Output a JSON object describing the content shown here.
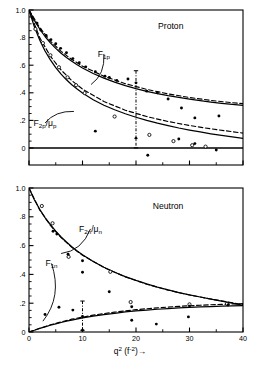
{
  "figure": {
    "background": "#ffffff",
    "ink": "#000000",
    "x_axis": {
      "label_main": "q",
      "label_exp": "2",
      "label_units": "(f",
      "label_units_exp": "-2",
      "label_units_close": ")",
      "arrow": "→",
      "full_label": "q2 (f-2)→",
      "ticks": [
        0,
        10,
        20,
        30,
        40
      ],
      "tick_labels": [
        "0",
        "10",
        "20",
        "30",
        "40"
      ],
      "range": [
        0,
        40
      ],
      "minor_tick_step": 5
    },
    "y_axis": {
      "ticks": [
        0,
        0.2,
        0.4,
        0.6,
        0.8,
        1.0
      ],
      "tick_labels": [
        "0",
        ".2",
        ".4",
        ".6",
        ".8",
        "1.0"
      ],
      "tick_labels_lower": [
        "0",
        ".2",
        ".4",
        ".6",
        ".8",
        "1.0"
      ],
      "range": [
        0,
        1.0
      ],
      "range_upper_panel": [
        -0.12,
        1.0
      ],
      "minor_tick_step": 0.05
    }
  },
  "chart_data": [
    {
      "type": "scatter",
      "panel": "upper",
      "title": "Proton",
      "xlabel": "",
      "ylabel": "",
      "xlim": [
        0,
        40
      ],
      "ylim": [
        -0.12,
        1.0
      ],
      "grid": false,
      "legend": "inline-annotations",
      "annotations": [
        {
          "text": "Proton",
          "x": 26.5,
          "y": 0.86
        },
        {
          "text": "F1p",
          "x": 14.0,
          "y": 0.66,
          "leader_to_x": 11.6,
          "leader_to_y": 0.46
        },
        {
          "text": "F2p/μp",
          "x": 3.0,
          "y": 0.16,
          "leader_to_x": 8.4,
          "leader_to_y": 0.265
        }
      ],
      "series": [
        {
          "name": "F1p solid model curve",
          "style": "solid-line",
          "x": [
            0,
            1,
            2,
            3,
            4,
            5,
            6,
            7,
            8,
            9,
            10,
            12,
            14,
            16,
            18,
            20,
            22,
            24,
            26,
            28,
            30,
            32,
            34,
            36,
            38,
            40
          ],
          "y": [
            1.0,
            0.925,
            0.862,
            0.808,
            0.762,
            0.722,
            0.687,
            0.656,
            0.628,
            0.603,
            0.58,
            0.54,
            0.506,
            0.477,
            0.452,
            0.43,
            0.411,
            0.394,
            0.379,
            0.366,
            0.354,
            0.343,
            0.333,
            0.324,
            0.316,
            0.309
          ]
        },
        {
          "name": "F1p dashed model curve",
          "style": "dashed-line",
          "x": [
            0,
            2,
            4,
            6,
            8,
            10,
            14,
            18,
            22,
            26,
            30,
            34,
            38,
            40
          ],
          "y": [
            1.0,
            0.872,
            0.775,
            0.7,
            0.641,
            0.593,
            0.52,
            0.466,
            0.425,
            0.392,
            0.366,
            0.345,
            0.328,
            0.321
          ]
        },
        {
          "name": "F2p/mu_p solid model curve",
          "style": "solid-line",
          "x": [
            0,
            1,
            2,
            3,
            4,
            5,
            6,
            7,
            8,
            9,
            10,
            12,
            14,
            16,
            18,
            20,
            22,
            24,
            26,
            28,
            30,
            32,
            34,
            36,
            38,
            40
          ],
          "y": [
            1.0,
            0.878,
            0.782,
            0.703,
            0.638,
            0.583,
            0.535,
            0.494,
            0.458,
            0.427,
            0.398,
            0.35,
            0.31,
            0.277,
            0.248,
            0.223,
            0.2,
            0.18,
            0.162,
            0.145,
            0.13,
            0.116,
            0.103,
            0.091,
            0.08,
            0.069
          ]
        },
        {
          "name": "F2p/mu_p dashed model curve",
          "style": "dashed-line",
          "x": [
            0,
            2,
            4,
            6,
            8,
            10,
            14,
            18,
            22,
            26,
            30,
            34,
            38,
            40
          ],
          "y": [
            1.0,
            0.8,
            0.665,
            0.565,
            0.488,
            0.427,
            0.337,
            0.274,
            0.228,
            0.192,
            0.163,
            0.139,
            0.118,
            0.108
          ]
        },
        {
          "name": "F1p measured points (filled)",
          "style": "filled-circle",
          "points": [
            {
              "x": 0.6,
              "y": 0.945
            },
            {
              "x": 1.5,
              "y": 0.905
            },
            {
              "x": 2.2,
              "y": 0.855
            },
            {
              "x": 3.2,
              "y": 0.815
            },
            {
              "x": 4.1,
              "y": 0.785
            },
            {
              "x": 5.0,
              "y": 0.755
            },
            {
              "x": 5.9,
              "y": 0.722
            },
            {
              "x": 7.0,
              "y": 0.69
            },
            {
              "x": 8.2,
              "y": 0.648
            },
            {
              "x": 9.4,
              "y": 0.618
            },
            {
              "x": 10.6,
              "y": 0.588
            },
            {
              "x": 12.4,
              "y": 0.552
            },
            {
              "x": 14.2,
              "y": 0.52
            },
            {
              "x": 15.0,
              "y": 0.512
            },
            {
              "x": 16.4,
              "y": 0.49
            },
            {
              "x": 18.5,
              "y": 0.5
            },
            {
              "x": 20.0,
              "y": 0.472
            },
            {
              "x": 22.0,
              "y": 0.412
            },
            {
              "x": 24.0,
              "y": 0.4
            },
            {
              "x": 26.0,
              "y": 0.355
            },
            {
              "x": 28.5,
              "y": 0.29
            },
            {
              "x": 31.0,
              "y": 0.218
            },
            {
              "x": 35.5,
              "y": 0.232
            }
          ]
        },
        {
          "name": "F2p/mu_p measured points (open)",
          "style": "open-circle",
          "points": [
            {
              "x": 1.2,
              "y": 0.862
            },
            {
              "x": 2.6,
              "y": 0.76
            },
            {
              "x": 4.0,
              "y": 0.672
            },
            {
              "x": 5.6,
              "y": 0.585
            },
            {
              "x": 7.2,
              "y": 0.512
            },
            {
              "x": 8.8,
              "y": 0.455
            },
            {
              "x": 10.4,
              "y": 0.398
            },
            {
              "x": 16.0,
              "y": 0.228
            },
            {
              "x": 22.5,
              "y": 0.095
            },
            {
              "x": 27.0,
              "y": 0.05
            },
            {
              "x": 30.5,
              "y": 0.02
            },
            {
              "x": 33.0,
              "y": 0.01
            }
          ]
        },
        {
          "name": "F2p/mu_p measured points (filled)",
          "style": "filled-circle",
          "points": [
            {
              "x": 12.4,
              "y": 0.122
            },
            {
              "x": 20.0,
              "y": 0.07
            },
            {
              "x": 22.2,
              "y": -0.052
            },
            {
              "x": 28.0,
              "y": 0.065
            },
            {
              "x": 31.0,
              "y": 0.032
            },
            {
              "x": 35.0,
              "y": -0.015
            }
          ]
        },
        {
          "name": "error bar at q2=20",
          "style": "dash-dot-errorbar",
          "x": 20.0,
          "y_top": 0.56,
          "y_bottom": 0.0,
          "cap": true
        }
      ]
    },
    {
      "type": "scatter",
      "panel": "lower",
      "title": "Neutron",
      "xlabel": "q2 (f-2)→",
      "ylabel": "",
      "xlim": [
        0,
        40
      ],
      "ylim": [
        0,
        1.0
      ],
      "grid": false,
      "legend": "inline-annotations",
      "annotations": [
        {
          "text": "Neutron",
          "x": 26.0,
          "y": 0.855
        },
        {
          "text": "F2n/μn",
          "x": 11.5,
          "y": 0.695,
          "leader_to_x": 6.0,
          "leader_to_y": 0.545
        },
        {
          "text": "F1n",
          "x": 4.2,
          "y": 0.455,
          "leader_to_x": 2.6,
          "leader_to_y": 0.075
        }
      ],
      "series": [
        {
          "name": "F2n/mu_n solid model curve",
          "style": "solid-line",
          "x": [
            0,
            1,
            2,
            3,
            4,
            5,
            6,
            7,
            8,
            9,
            10,
            12,
            14,
            16,
            18,
            20,
            22,
            24,
            26,
            28,
            30,
            32,
            34,
            36,
            38,
            40
          ],
          "y": [
            1.0,
            0.918,
            0.852,
            0.795,
            0.745,
            0.7,
            0.66,
            0.625,
            0.592,
            0.563,
            0.536,
            0.49,
            0.45,
            0.415,
            0.385,
            0.358,
            0.334,
            0.312,
            0.292,
            0.274,
            0.258,
            0.243,
            0.229,
            0.215,
            0.2,
            0.185
          ]
        },
        {
          "name": "F2n/mu_n dashed model curve",
          "style": "dashed-line",
          "x": [
            0,
            2,
            4,
            6,
            8,
            10,
            14,
            18,
            22,
            26,
            30,
            34,
            38,
            40
          ],
          "y": [
            1.0,
            0.848,
            0.74,
            0.655,
            0.588,
            0.533,
            0.448,
            0.383,
            0.332,
            0.291,
            0.257,
            0.229,
            0.203,
            0.19
          ]
        },
        {
          "name": "F1n solid model curve",
          "style": "solid-line",
          "x": [
            0,
            1,
            2,
            3,
            4,
            5,
            6,
            7,
            8,
            10,
            12,
            14,
            16,
            18,
            20,
            22,
            24,
            26,
            28,
            30,
            32,
            34,
            36,
            38,
            40
          ],
          "y": [
            0.0,
            0.012,
            0.025,
            0.036,
            0.047,
            0.057,
            0.066,
            0.075,
            0.083,
            0.098,
            0.11,
            0.121,
            0.13,
            0.139,
            0.146,
            0.152,
            0.158,
            0.163,
            0.167,
            0.171,
            0.174,
            0.177,
            0.179,
            0.181,
            0.183
          ]
        },
        {
          "name": "F1n dashed model curve",
          "style": "dashed-line",
          "x": [
            0,
            4,
            8,
            12,
            16,
            20,
            24,
            28,
            32,
            36,
            40
          ],
          "y": [
            0.0,
            0.05,
            0.089,
            0.117,
            0.138,
            0.155,
            0.168,
            0.178,
            0.186,
            0.192,
            0.197
          ]
        },
        {
          "name": "F2n/mu_n measured points (open)",
          "style": "open-circle",
          "points": [
            {
              "x": 2.4,
              "y": 0.875
            },
            {
              "x": 4.4,
              "y": 0.755
            },
            {
              "x": 7.4,
              "y": 0.522
            },
            {
              "x": 15.2,
              "y": 0.418
            },
            {
              "x": 19.0,
              "y": 0.208
            },
            {
              "x": 30.0,
              "y": 0.192
            },
            {
              "x": 37.0,
              "y": 0.195
            }
          ]
        },
        {
          "name": "F2n/mu_n measured points (filled)",
          "style": "filled-circle",
          "points": [
            {
              "x": 4.5,
              "y": 0.7
            },
            {
              "x": 5.2,
              "y": 0.68
            },
            {
              "x": 7.3,
              "y": 0.54
            },
            {
              "x": 10.0,
              "y": 0.495
            },
            {
              "x": 10.0,
              "y": 0.415
            },
            {
              "x": 15.0,
              "y": 0.28
            },
            {
              "x": 19.2,
              "y": 0.175
            },
            {
              "x": 30.0,
              "y": 0.18
            },
            {
              "x": 37.2,
              "y": 0.188
            }
          ]
        },
        {
          "name": "F1n measured points (filled)",
          "style": "filled-circle",
          "points": [
            {
              "x": 3.0,
              "y": 0.122
            },
            {
              "x": 5.6,
              "y": 0.172
            },
            {
              "x": 8.2,
              "y": 0.152
            },
            {
              "x": 10.0,
              "y": 0.108
            },
            {
              "x": 10.0,
              "y": 0.012
            },
            {
              "x": 19.2,
              "y": 0.082
            },
            {
              "x": 23.8,
              "y": 0.055
            },
            {
              "x": 29.8,
              "y": 0.105
            }
          ]
        },
        {
          "name": "error bar at q2=10",
          "style": "dash-dot-errorbar",
          "x": 10.0,
          "y_top": 0.215,
          "y_bottom": 0.012,
          "cap": true
        }
      ]
    }
  ]
}
